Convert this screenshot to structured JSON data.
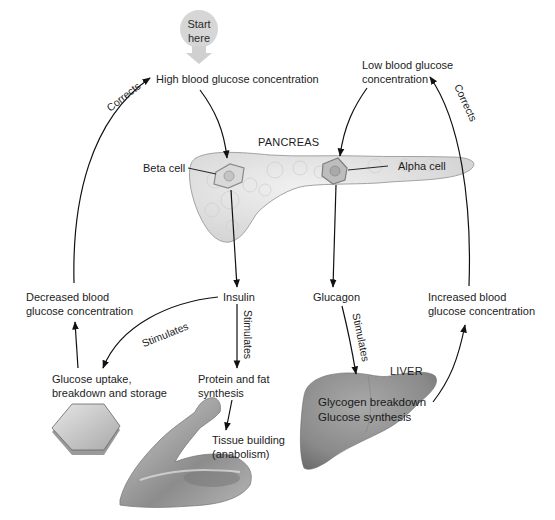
{
  "diagram": {
    "start": {
      "label_line1": "Start",
      "label_line2": "here"
    },
    "nodes": {
      "high_glucose": "High blood glucose concentration",
      "low_glucose_line1": "Low blood glucose",
      "low_glucose_line2": "concentration",
      "pancreas": "PANCREAS",
      "beta_cell": "Beta cell",
      "alpha_cell": "Alpha cell",
      "insulin": "Insulin",
      "glucagon": "Glucagon",
      "decreased_line1": "Decreased blood",
      "decreased_line2": "glucose concentration",
      "increased_line1": "Increased blood",
      "increased_line2": "glucose concentration",
      "uptake_line1": "Glucose uptake,",
      "uptake_line2": "breakdown and storage",
      "protein_line1": "Protein and fat",
      "protein_line2": "synthesis",
      "tissue_line1": "Tissue building",
      "tissue_line2": "(anabolism)",
      "liver": "LIVER",
      "liver_line1": "Glycogen breakdown",
      "liver_line2": "Glucose synthesis"
    },
    "edge_labels": {
      "corrects_left": "Corrects",
      "corrects_right": "Corrects",
      "stimulates_uptake": "Stimulates",
      "stimulates_protein": "Stimulates",
      "stimulates_liver": "Stimulates"
    },
    "colors": {
      "arrow": "#111111",
      "pancreas_fill": "#e4e4e4",
      "pancreas_stroke": "#a8a8a8",
      "liver_fill": "#8f8f8f",
      "start_bubble": "#d4d4d4",
      "hexagon_fill": "#c8c8c8"
    }
  }
}
